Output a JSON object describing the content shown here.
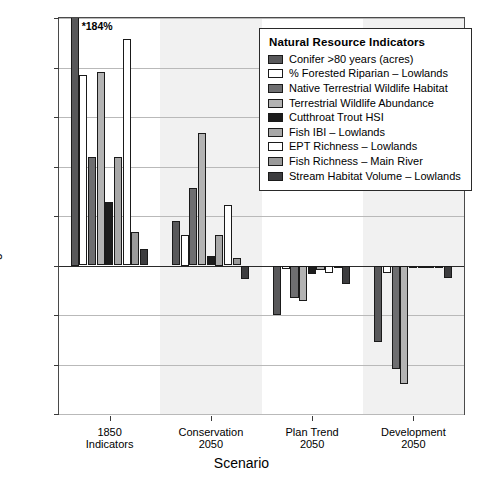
{
  "chart_data": {
    "type": "bar",
    "title": "",
    "xlabel": "Scenario",
    "ylabel": "Percent Change Relative to 1990",
    "ylim": [
      -60,
      100
    ],
    "yticks": [
      100,
      80,
      60,
      40,
      20,
      0,
      -20,
      -40,
      -60
    ],
    "ytick_labels": [
      "100",
      "80",
      "60",
      "40",
      "20",
      "0",
      "-20",
      "-40",
      "-60"
    ],
    "grid": true,
    "legend_position": "upper-right",
    "legend_title": "Natural Resource Indicators",
    "categories": [
      "1850\nIndicators",
      "Conservation\n2050",
      "Plan Trend\n2050",
      "Development\n2050"
    ],
    "category_lines": [
      [
        "1850",
        "Indicators"
      ],
      [
        "Conservation",
        "2050"
      ],
      [
        "Plan Trend",
        "2050"
      ],
      [
        "Development",
        "2050"
      ]
    ],
    "annotations": [
      {
        "text": "*184%",
        "series": "Conifer >80 years (acres)",
        "category": "1850 Indicators",
        "actual_value": 184,
        "clipped_at": 100
      }
    ],
    "series": [
      {
        "name": "Conifer >80 years (acres)",
        "color": "#58585a",
        "values": [
          184,
          18,
          -20,
          -31
        ]
      },
      {
        "name": "% Forested Riparian – Lowlands",
        "color": "#ffffff",
        "values": [
          77,
          12.5,
          -1.5,
          -3
        ]
      },
      {
        "name": "Native Terrestrial Wildlife Habitat",
        "color": "#6e6e70",
        "values": [
          44,
          31.5,
          -13,
          -42
        ]
      },
      {
        "name": "Terrestrial Wildlife Abundance",
        "color": "#b3b3b3",
        "values": [
          78,
          53.5,
          -14.5,
          -48
        ]
      },
      {
        "name": "Cutthroat Trout HSI",
        "color": "#1c1c1c",
        "values": [
          25.5,
          4,
          -3.5,
          -1
        ]
      },
      {
        "name": "Fish IBI – Lowlands",
        "color": "#a8a8a8",
        "values": [
          44,
          12.5,
          -2,
          -1
        ]
      },
      {
        "name": "EPT Richness – Lowlands",
        "color": "#ffffff",
        "values": [
          91.5,
          24.5,
          -3,
          -1
        ]
      },
      {
        "name": "Fish Richness – Main River",
        "color": "#9a9a9a",
        "values": [
          13.5,
          3,
          -1,
          -1
        ]
      },
      {
        "name": "Stream Habitat Volume – Lowlands",
        "color": "#3d3d3f",
        "values": [
          6.5,
          -5.5,
          -7.5,
          -5
        ]
      }
    ]
  }
}
